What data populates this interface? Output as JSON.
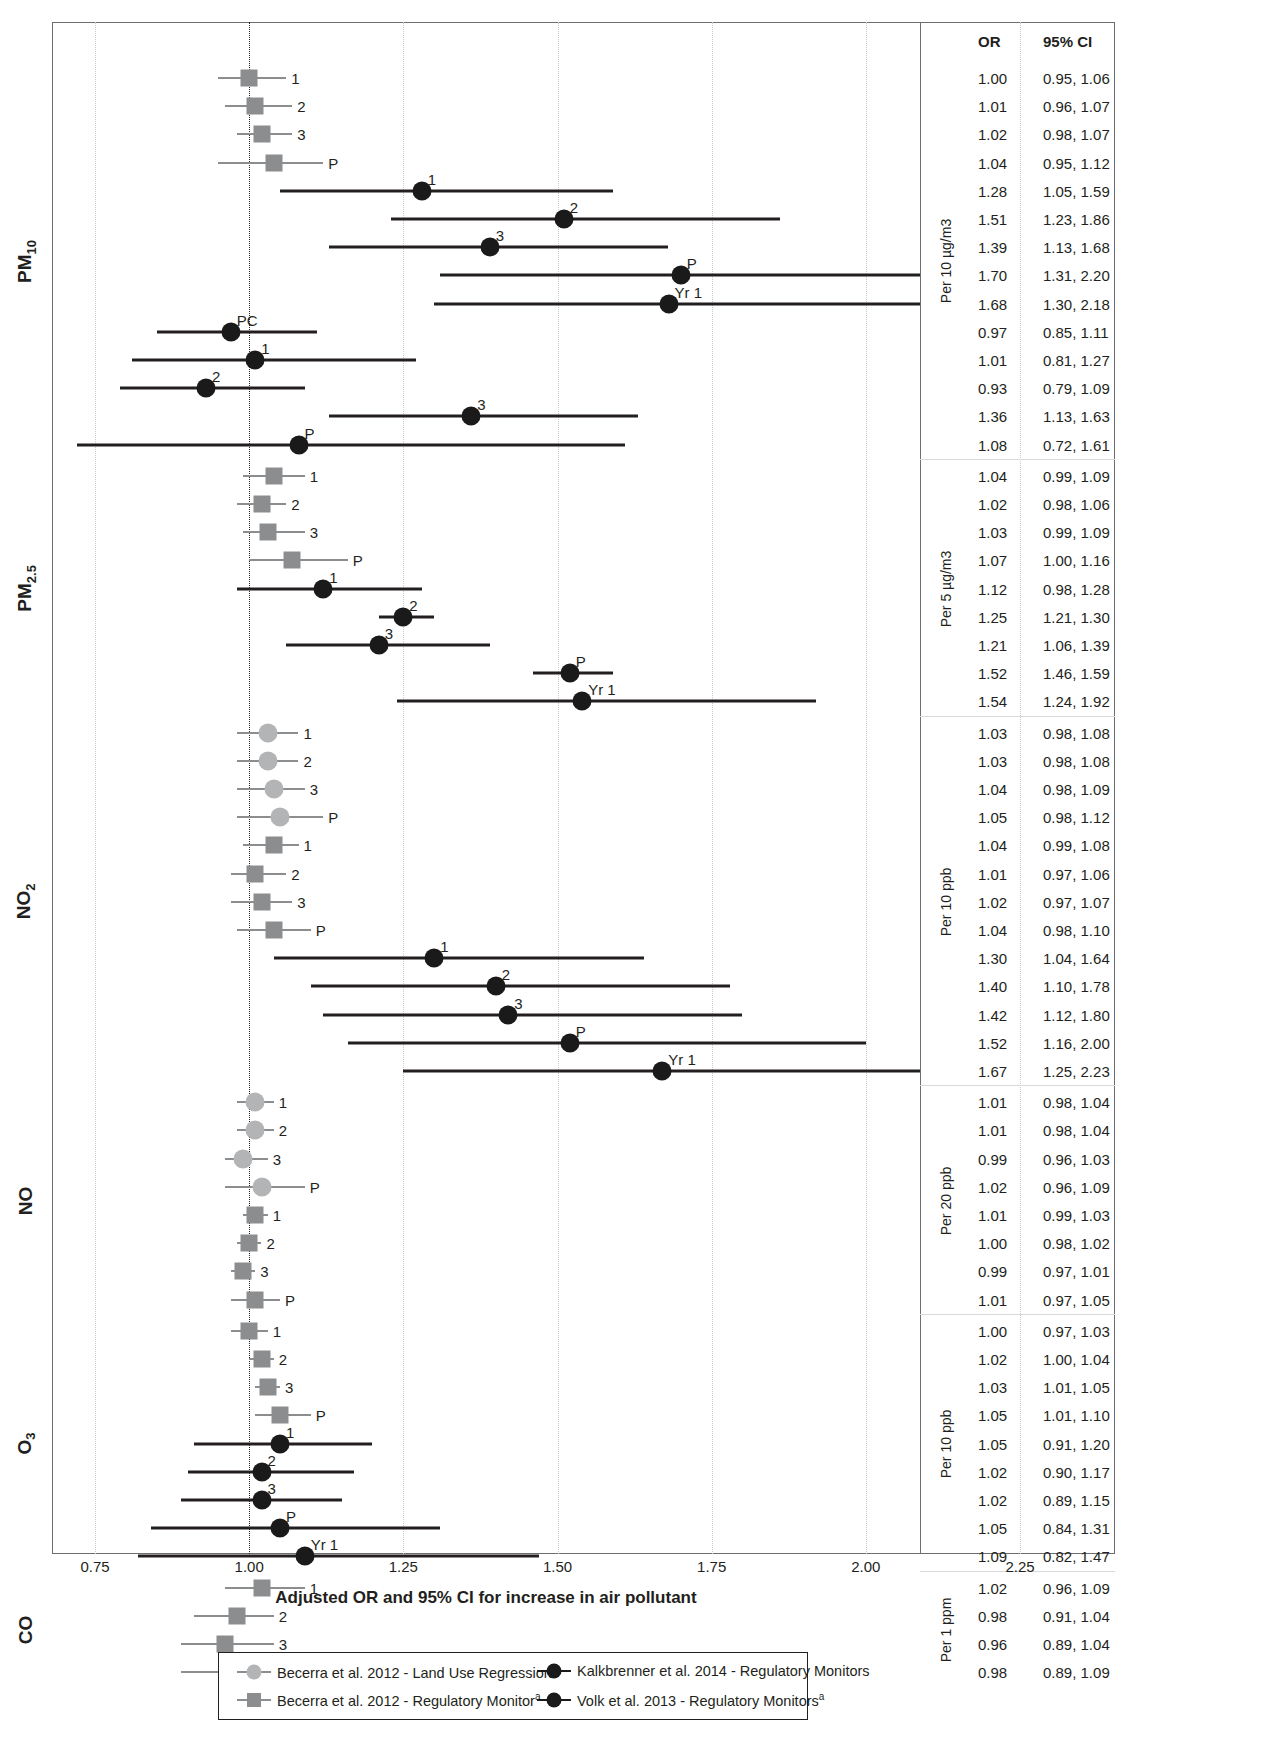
{
  "chart_data": {
    "type": "forest",
    "title": "",
    "xlabel": "Adjusted OR and 95% CI for increase in air pollutant",
    "xlim": [
      0.7,
      2.3
    ],
    "xticks": [
      "0.75",
      "1.00",
      "1.25",
      "1.50",
      "1.75",
      "2.00",
      "2.25"
    ],
    "xtick_values": [
      0.75,
      1.0,
      1.25,
      1.5,
      1.75,
      2.0,
      2.25
    ],
    "reference_line": 1.0,
    "grid": true,
    "columns": [
      "OR",
      "95% CI"
    ],
    "groups": [
      {
        "pollutant": "PM",
        "pollutant_sub": "10",
        "unit": "Per 10 µg/m3",
        "rows": [
          {
            "label": "1",
            "or": 1.0,
            "lo": 0.95,
            "hi": 1.06,
            "or_text": "1.00",
            "ci_text": "0.95, 1.06",
            "style": "sq-light",
            "label_pos": "right"
          },
          {
            "label": "2",
            "or": 1.01,
            "lo": 0.96,
            "hi": 1.07,
            "or_text": "1.01",
            "ci_text": "0.96, 1.07",
            "style": "sq-light",
            "label_pos": "right"
          },
          {
            "label": "3",
            "or": 1.02,
            "lo": 0.98,
            "hi": 1.07,
            "or_text": "1.02",
            "ci_text": "0.98, 1.07",
            "style": "sq-light",
            "label_pos": "right"
          },
          {
            "label": "P",
            "or": 1.04,
            "lo": 0.95,
            "hi": 1.12,
            "or_text": "1.04",
            "ci_text": "0.95, 1.12",
            "style": "sq-light",
            "label_pos": "right"
          },
          {
            "label": "1",
            "or": 1.28,
            "lo": 1.05,
            "hi": 1.59,
            "or_text": "1.28",
            "ci_text": "1.05, 1.59",
            "style": "circ-dark",
            "label_pos": "above"
          },
          {
            "label": "2",
            "or": 1.51,
            "lo": 1.23,
            "hi": 1.86,
            "or_text": "1.51",
            "ci_text": "1.23, 1.86",
            "style": "circ-dark",
            "label_pos": "above"
          },
          {
            "label": "3",
            "or": 1.39,
            "lo": 1.13,
            "hi": 1.68,
            "or_text": "1.39",
            "ci_text": "1.13, 1.68",
            "style": "circ-dark",
            "label_pos": "above"
          },
          {
            "label": "P",
            "or": 1.7,
            "lo": 1.31,
            "hi": 2.2,
            "or_text": "1.70",
            "ci_text": "1.31, 2.20",
            "style": "circ-dark",
            "label_pos": "above"
          },
          {
            "label": "Yr 1",
            "or": 1.68,
            "lo": 1.3,
            "hi": 2.18,
            "or_text": "1.68",
            "ci_text": "1.30, 2.18",
            "style": "circ-dark",
            "label_pos": "above"
          },
          {
            "label": "PC",
            "or": 0.97,
            "lo": 0.85,
            "hi": 1.11,
            "or_text": "0.97",
            "ci_text": "0.85, 1.11",
            "style": "circ-dark",
            "label_pos": "above"
          },
          {
            "label": "1",
            "or": 1.01,
            "lo": 0.81,
            "hi": 1.27,
            "or_text": "1.01",
            "ci_text": "0.81, 1.27",
            "style": "circ-dark",
            "label_pos": "above"
          },
          {
            "label": "2",
            "or": 0.93,
            "lo": 0.79,
            "hi": 1.09,
            "or_text": "0.93",
            "ci_text": "0.79, 1.09",
            "style": "circ-dark",
            "label_pos": "above"
          },
          {
            "label": "3",
            "or": 1.36,
            "lo": 1.13,
            "hi": 1.63,
            "or_text": "1.36",
            "ci_text": "1.13, 1.63",
            "style": "circ-dark",
            "label_pos": "above"
          },
          {
            "label": "P",
            "or": 1.08,
            "lo": 0.72,
            "hi": 1.61,
            "or_text": "1.08",
            "ci_text": "0.72, 1.61",
            "style": "circ-dark",
            "label_pos": "above"
          }
        ]
      },
      {
        "pollutant": "PM",
        "pollutant_sub": "2.5",
        "unit": "Per 5 µg/m3",
        "rows": [
          {
            "label": "1",
            "or": 1.04,
            "lo": 0.99,
            "hi": 1.09,
            "or_text": "1.04",
            "ci_text": "0.99, 1.09",
            "style": "sq-light",
            "label_pos": "right"
          },
          {
            "label": "2",
            "or": 1.02,
            "lo": 0.98,
            "hi": 1.06,
            "or_text": "1.02",
            "ci_text": "0.98, 1.06",
            "style": "sq-light",
            "label_pos": "right"
          },
          {
            "label": "3",
            "or": 1.03,
            "lo": 0.99,
            "hi": 1.09,
            "or_text": "1.03",
            "ci_text": "0.99, 1.09",
            "style": "sq-light",
            "label_pos": "right"
          },
          {
            "label": "P",
            "or": 1.07,
            "lo": 1.0,
            "hi": 1.16,
            "or_text": "1.07",
            "ci_text": "1.00, 1.16",
            "style": "sq-light",
            "label_pos": "right"
          },
          {
            "label": "1",
            "or": 1.12,
            "lo": 0.98,
            "hi": 1.28,
            "or_text": "1.12",
            "ci_text": "0.98, 1.28",
            "style": "circ-dark",
            "label_pos": "above"
          },
          {
            "label": "2",
            "or": 1.25,
            "lo": 1.21,
            "hi": 1.3,
            "or_text": "1.25",
            "ci_text": "1.21, 1.30",
            "style": "circ-dark",
            "label_pos": "above"
          },
          {
            "label": "3",
            "or": 1.21,
            "lo": 1.06,
            "hi": 1.39,
            "or_text": "1.21",
            "ci_text": "1.06, 1.39",
            "style": "circ-dark",
            "label_pos": "above"
          },
          {
            "label": "P",
            "or": 1.52,
            "lo": 1.46,
            "hi": 1.59,
            "or_text": "1.52",
            "ci_text": "1.46, 1.59",
            "style": "circ-dark",
            "label_pos": "above"
          },
          {
            "label": "Yr 1",
            "or": 1.54,
            "lo": 1.24,
            "hi": 1.92,
            "or_text": "1.54",
            "ci_text": "1.24, 1.92",
            "style": "circ-dark",
            "label_pos": "above"
          }
        ]
      },
      {
        "pollutant": "NO",
        "pollutant_sub": "2",
        "unit": "Per 10 ppb",
        "rows": [
          {
            "label": "1",
            "or": 1.03,
            "lo": 0.98,
            "hi": 1.08,
            "or_text": "1.03",
            "ci_text": "0.98, 1.08",
            "style": "ci-light",
            "label_pos": "right"
          },
          {
            "label": "2",
            "or": 1.03,
            "lo": 0.98,
            "hi": 1.08,
            "or_text": "1.03",
            "ci_text": "0.98, 1.08",
            "style": "ci-light",
            "label_pos": "right"
          },
          {
            "label": "3",
            "or": 1.04,
            "lo": 0.98,
            "hi": 1.09,
            "or_text": "1.04",
            "ci_text": "0.98, 1.09",
            "style": "ci-light",
            "label_pos": "right"
          },
          {
            "label": "P",
            "or": 1.05,
            "lo": 0.98,
            "hi": 1.12,
            "or_text": "1.05",
            "ci_text": "0.98, 1.12",
            "style": "ci-light",
            "label_pos": "right"
          },
          {
            "label": "1",
            "or": 1.04,
            "lo": 0.99,
            "hi": 1.08,
            "or_text": "1.04",
            "ci_text": "0.99, 1.08",
            "style": "sq-light",
            "label_pos": "right"
          },
          {
            "label": "2",
            "or": 1.01,
            "lo": 0.97,
            "hi": 1.06,
            "or_text": "1.01",
            "ci_text": "0.97, 1.06",
            "style": "sq-light",
            "label_pos": "right"
          },
          {
            "label": "3",
            "or": 1.02,
            "lo": 0.97,
            "hi": 1.07,
            "or_text": "1.02",
            "ci_text": "0.97, 1.07",
            "style": "sq-light",
            "label_pos": "right"
          },
          {
            "label": "P",
            "or": 1.04,
            "lo": 0.98,
            "hi": 1.1,
            "or_text": "1.04",
            "ci_text": "0.98, 1.10",
            "style": "sq-light",
            "label_pos": "right"
          },
          {
            "label": "1",
            "or": 1.3,
            "lo": 1.04,
            "hi": 1.64,
            "or_text": "1.30",
            "ci_text": "1.04, 1.64",
            "style": "circ-dark",
            "label_pos": "above"
          },
          {
            "label": "2",
            "or": 1.4,
            "lo": 1.1,
            "hi": 1.78,
            "or_text": "1.40",
            "ci_text": "1.10, 1.78",
            "style": "circ-dark",
            "label_pos": "above"
          },
          {
            "label": "3",
            "or": 1.42,
            "lo": 1.12,
            "hi": 1.8,
            "or_text": "1.42",
            "ci_text": "1.12, 1.80",
            "style": "circ-dark",
            "label_pos": "above"
          },
          {
            "label": "P",
            "or": 1.52,
            "lo": 1.16,
            "hi": 2.0,
            "or_text": "1.52",
            "ci_text": "1.16, 2.00",
            "style": "circ-dark",
            "label_pos": "above"
          },
          {
            "label": "Yr 1",
            "or": 1.67,
            "lo": 1.25,
            "hi": 2.23,
            "or_text": "1.67",
            "ci_text": "1.25, 2.23",
            "style": "circ-dark",
            "label_pos": "above"
          }
        ]
      },
      {
        "pollutant": "NO",
        "pollutant_sub": "",
        "unit": "Per 20 ppb",
        "rows": [
          {
            "label": "1",
            "or": 1.01,
            "lo": 0.98,
            "hi": 1.04,
            "or_text": "1.01",
            "ci_text": "0.98, 1.04",
            "style": "ci-light",
            "label_pos": "right"
          },
          {
            "label": "2",
            "or": 1.01,
            "lo": 0.98,
            "hi": 1.04,
            "or_text": "1.01",
            "ci_text": "0.98, 1.04",
            "style": "ci-light",
            "label_pos": "right"
          },
          {
            "label": "3",
            "or": 0.99,
            "lo": 0.96,
            "hi": 1.03,
            "or_text": "0.99",
            "ci_text": "0.96, 1.03",
            "style": "ci-light",
            "label_pos": "right"
          },
          {
            "label": "P",
            "or": 1.02,
            "lo": 0.96,
            "hi": 1.09,
            "or_text": "1.02",
            "ci_text": "0.96, 1.09",
            "style": "ci-light",
            "label_pos": "right"
          },
          {
            "label": "1",
            "or": 1.01,
            "lo": 0.99,
            "hi": 1.03,
            "or_text": "1.01",
            "ci_text": "0.99, 1.03",
            "style": "sq-light",
            "label_pos": "right"
          },
          {
            "label": "2",
            "or": 1.0,
            "lo": 0.98,
            "hi": 1.02,
            "or_text": "1.00",
            "ci_text": "0.98, 1.02",
            "style": "sq-light",
            "label_pos": "right"
          },
          {
            "label": "3",
            "or": 0.99,
            "lo": 0.97,
            "hi": 1.01,
            "or_text": "0.99",
            "ci_text": "0.97, 1.01",
            "style": "sq-light",
            "label_pos": "right"
          },
          {
            "label": "P",
            "or": 1.01,
            "lo": 0.97,
            "hi": 1.05,
            "or_text": "1.01",
            "ci_text": "0.97, 1.05",
            "style": "sq-light",
            "label_pos": "right"
          }
        ]
      },
      {
        "pollutant": "O",
        "pollutant_sub": "3",
        "unit": "Per 10 ppb",
        "rows": [
          {
            "label": "1",
            "or": 1.0,
            "lo": 0.97,
            "hi": 1.03,
            "or_text": "1.00",
            "ci_text": "0.97, 1.03",
            "style": "sq-light",
            "label_pos": "right"
          },
          {
            "label": "2",
            "or": 1.02,
            "lo": 1.0,
            "hi": 1.04,
            "or_text": "1.02",
            "ci_text": "1.00, 1.04",
            "style": "sq-light",
            "label_pos": "right"
          },
          {
            "label": "3",
            "or": 1.03,
            "lo": 1.01,
            "hi": 1.05,
            "or_text": "1.03",
            "ci_text": "1.01, 1.05",
            "style": "sq-light",
            "label_pos": "right"
          },
          {
            "label": "P",
            "or": 1.05,
            "lo": 1.01,
            "hi": 1.1,
            "or_text": "1.05",
            "ci_text": "1.01, 1.10",
            "style": "sq-light",
            "label_pos": "right"
          },
          {
            "label": "1",
            "or": 1.05,
            "lo": 0.91,
            "hi": 1.2,
            "or_text": "1.05",
            "ci_text": "0.91, 1.20",
            "style": "circ-dark",
            "label_pos": "above"
          },
          {
            "label": "2",
            "or": 1.02,
            "lo": 0.9,
            "hi": 1.17,
            "or_text": "1.02",
            "ci_text": "0.90, 1.17",
            "style": "circ-dark",
            "label_pos": "above"
          },
          {
            "label": "3",
            "or": 1.02,
            "lo": 0.89,
            "hi": 1.15,
            "or_text": "1.02",
            "ci_text": "0.89, 1.15",
            "style": "circ-dark",
            "label_pos": "above"
          },
          {
            "label": "P",
            "or": 1.05,
            "lo": 0.84,
            "hi": 1.31,
            "or_text": "1.05",
            "ci_text": "0.84, 1.31",
            "style": "circ-dark",
            "label_pos": "above"
          },
          {
            "label": "Yr 1",
            "or": 1.09,
            "lo": 0.82,
            "hi": 1.47,
            "or_text": "1.09",
            "ci_text": "0.82, 1.47",
            "style": "circ-dark",
            "label_pos": "above"
          }
        ]
      },
      {
        "pollutant": "CO",
        "pollutant_sub": "",
        "unit": "Per 1 ppm",
        "rows": [
          {
            "label": "1",
            "or": 1.02,
            "lo": 0.96,
            "hi": 1.09,
            "or_text": "1.02",
            "ci_text": "0.96, 1.09",
            "style": "sq-light",
            "label_pos": "right"
          },
          {
            "label": "2",
            "or": 0.98,
            "lo": 0.91,
            "hi": 1.04,
            "or_text": "0.98",
            "ci_text": "0.91, 1.04",
            "style": "sq-light",
            "label_pos": "right"
          },
          {
            "label": "3",
            "or": 0.96,
            "lo": 0.89,
            "hi": 1.04,
            "or_text": "0.96",
            "ci_text": "0.89, 1.04",
            "style": "sq-light",
            "label_pos": "right"
          },
          {
            "label": "P",
            "or": 0.98,
            "lo": 0.89,
            "hi": 1.09,
            "or_text": "0.98",
            "ci_text": "0.89, 1.09",
            "style": "sq-light",
            "label_pos": "right"
          }
        ]
      }
    ],
    "legend": {
      "position": "bottom",
      "entries": [
        {
          "marker": "circle-light",
          "label": "Becerra et al. 2012 - Land Use Regression",
          "footnote": "a",
          "color": "#b3b4b6"
        },
        {
          "marker": "circle-dark",
          "label": "Kalkbrenner et al. 2014 - Regulatory Monitors",
          "footnote": "",
          "color": "#1a1a1a"
        },
        {
          "marker": "square-light",
          "label": "Becerra et al. 2012 - Regulatory Monitor",
          "footnote": "a",
          "color": "#8c8d8f"
        },
        {
          "marker": "circle-dark",
          "label": "Volk et al. 2013 - Regulatory Monitors",
          "footnote": "a",
          "color": "#1a1a1a"
        }
      ]
    }
  },
  "colors": {
    "light_marker": "#b3b4b6",
    "grey_marker": "#8c8d8f",
    "dark_marker": "#1a1a1a",
    "axis": "#6d6e71",
    "grid": "#c9cacc",
    "text": "#231f20"
  }
}
